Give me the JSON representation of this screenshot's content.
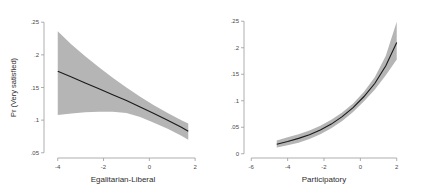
{
  "figure": {
    "background_color": "#ffffff",
    "band_color": "#b5b5b5",
    "line_color": "#1a1a1a",
    "axis_color": "#9a9a9a"
  },
  "chart_data": [
    {
      "type": "line",
      "panel": "left",
      "title": "",
      "xlabel": "Egalitarian-Liberal",
      "ylabel": "Pr (Very satisfied)",
      "xlim": [
        -4.6,
        2.3
      ],
      "ylim": [
        0.042,
        0.258
      ],
      "xticks": [
        -4,
        -2,
        0,
        2
      ],
      "xticklabels": [
        "-4",
        "-2",
        "0",
        "2"
      ],
      "yticks": [
        0.05,
        0.1,
        0.15,
        0.2,
        0.25
      ],
      "yticklabels": [
        ".05",
        ".1",
        ".15",
        ".2",
        ".25"
      ],
      "grid": false,
      "legend": "none",
      "series": [
        {
          "name": "Predicted probability",
          "x": [
            -4.0,
            -3.4,
            -2.8,
            -2.2,
            -1.6,
            -1.0,
            -0.4,
            0.2,
            0.8,
            1.4,
            1.7
          ],
          "values": [
            0.175,
            0.166,
            0.157,
            0.148,
            0.139,
            0.13,
            0.12,
            0.11,
            0.1,
            0.089,
            0.083
          ]
        },
        {
          "name": "95% CI upper",
          "x": [
            -4.0,
            -3.4,
            -2.8,
            -2.2,
            -1.6,
            -1.0,
            -0.4,
            0.2,
            0.8,
            1.4,
            1.7
          ],
          "values": [
            0.236,
            0.216,
            0.198,
            0.181,
            0.165,
            0.15,
            0.136,
            0.123,
            0.111,
            0.1,
            0.095
          ]
        },
        {
          "name": "95% CI lower",
          "x": [
            -4.0,
            -3.4,
            -2.8,
            -2.2,
            -1.6,
            -1.0,
            -0.4,
            0.2,
            0.8,
            1.4,
            1.7
          ],
          "values": [
            0.108,
            0.11,
            0.112,
            0.113,
            0.113,
            0.111,
            0.105,
            0.096,
            0.087,
            0.076,
            0.07
          ]
        }
      ]
    },
    {
      "type": "line",
      "panel": "right",
      "title": "",
      "xlabel": "Participatory",
      "ylabel": "",
      "xlim": [
        -6.4,
        2.4
      ],
      "ylim": [
        -0.008,
        0.258
      ],
      "xticks": [
        -6,
        -4,
        -2,
        0,
        2
      ],
      "xticklabels": [
        "-6",
        "-4",
        "-2",
        "0",
        "2"
      ],
      "yticks": [
        0,
        0.05,
        0.1,
        0.15,
        0.2,
        0.25
      ],
      "yticklabels": [
        "0",
        ".05",
        ".1",
        ".15",
        ".2",
        ".25"
      ],
      "grid": false,
      "legend": "none",
      "series": [
        {
          "name": "Predicted probability",
          "x": [
            -4.6,
            -4.0,
            -3.4,
            -2.8,
            -2.2,
            -1.6,
            -1.0,
            -0.4,
            0.2,
            0.8,
            1.4,
            2.0
          ],
          "values": [
            0.018,
            0.023,
            0.029,
            0.036,
            0.045,
            0.056,
            0.07,
            0.087,
            0.108,
            0.133,
            0.166,
            0.21
          ]
        },
        {
          "name": "95% CI upper",
          "x": [
            -4.6,
            -4.0,
            -3.4,
            -2.8,
            -2.2,
            -1.6,
            -1.0,
            -0.4,
            0.2,
            0.8,
            1.4,
            2.0
          ],
          "values": [
            0.025,
            0.031,
            0.037,
            0.044,
            0.053,
            0.064,
            0.078,
            0.095,
            0.117,
            0.145,
            0.185,
            0.249
          ]
        },
        {
          "name": "95% CI lower",
          "x": [
            -4.6,
            -4.0,
            -3.4,
            -2.8,
            -2.2,
            -1.6,
            -1.0,
            -0.4,
            0.2,
            0.8,
            1.4,
            2.0
          ],
          "values": [
            0.012,
            0.016,
            0.021,
            0.028,
            0.037,
            0.048,
            0.062,
            0.079,
            0.099,
            0.121,
            0.148,
            0.178
          ]
        }
      ]
    }
  ]
}
